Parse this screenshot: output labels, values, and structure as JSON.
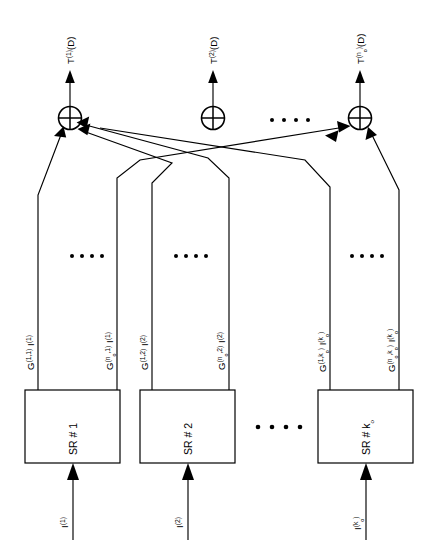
{
  "figure": {
    "orientation": "rotated-90-ccw",
    "colors": {
      "ink": "#000000",
      "paper": "#ffffff"
    }
  },
  "outputs": [
    {
      "id": "out-1",
      "base": "T",
      "sup": "(1)",
      "tail": "(D)"
    },
    {
      "id": "out-2",
      "base": "T",
      "sup": "(2)",
      "tail": "(D)"
    },
    {
      "id": "out-no",
      "base": "T",
      "sup_pre": "(n",
      "sup_sub": "o",
      "sup_post": ")",
      "tail": "(D)"
    }
  ],
  "adders": [
    {
      "id": "adder-1",
      "symbol": "xor"
    },
    {
      "id": "adder-2",
      "symbol": "xor"
    },
    {
      "id": "adder-no",
      "symbol": "xor"
    }
  ],
  "taps": [
    {
      "id": "tap-1-1",
      "g_base": "G",
      "g_sup": "(1,1)",
      "i_base": "I",
      "i_sup": "(1)"
    },
    {
      "id": "tap-no-1",
      "g_base": "G",
      "g_sup": "(n o ,1)",
      "i_base": "I",
      "i_sup": "(1)"
    },
    {
      "id": "tap-1-2",
      "g_base": "G",
      "g_sup": "(1,2)",
      "i_base": "I",
      "i_sup": "(2)"
    },
    {
      "id": "tap-no-2",
      "g_base": "G",
      "g_sup": "(n o ,2)",
      "i_base": "I",
      "i_sup": "(2)"
    },
    {
      "id": "tap-1-ko",
      "g_base": "G",
      "g_sup": "(1,k o )",
      "i_base": "I",
      "i_sup": "(k o )"
    },
    {
      "id": "tap-no-ko",
      "g_base": "G",
      "g_sup": "(n o ,k o )",
      "i_base": "I",
      "i_sup": "(k o )"
    }
  ],
  "registers": [
    {
      "id": "sr-1",
      "prefix": "SR",
      "hash": "#",
      "index": "1",
      "input_base": "I",
      "input_sup": "(1)"
    },
    {
      "id": "sr-2",
      "prefix": "SR",
      "hash": "#",
      "index": "2",
      "input_base": "I",
      "input_sup": "(2)"
    },
    {
      "id": "sr-ko",
      "prefix": "SR",
      "hash": "#",
      "index": "k o",
      "input_base": "I",
      "input_sup": "(k o )"
    }
  ],
  "ellipses": [
    {
      "id": "ellipsis-adders",
      "glyph": "• • • •"
    },
    {
      "id": "ellipsis-taps-1",
      "glyph": "• • • •"
    },
    {
      "id": "ellipsis-taps-2",
      "glyph": "• • • •"
    },
    {
      "id": "ellipsis-taps-ko",
      "glyph": "• • • •"
    },
    {
      "id": "ellipsis-registers",
      "glyph": "• • • •"
    }
  ]
}
